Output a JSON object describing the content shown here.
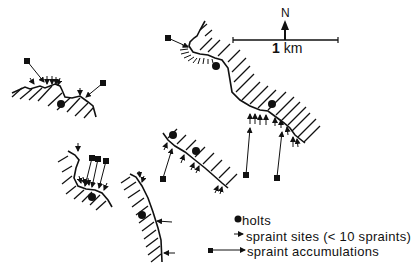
{
  "figure": {
    "north_label": "N",
    "scale": {
      "value": "1",
      "unit": "km"
    },
    "legend": {
      "items": [
        {
          "symbol": "filled-dot",
          "label": "holts"
        },
        {
          "symbol": "short-arrow",
          "label": "spraint sites (< 10 spraints)"
        },
        {
          "symbol": "long-arrow-with-square-tail",
          "label": "spraint accumulations"
        }
      ]
    },
    "colors": {
      "ink": "#111111",
      "background": "#ffffff"
    },
    "segments": [
      {
        "id": "segment-1",
        "location": "upper-left",
        "holts": 1,
        "accumulations": 2
      },
      {
        "id": "segment-2",
        "location": "upper-right (long diagonal)",
        "holts": 2,
        "accumulations": 3
      },
      {
        "id": "segment-3",
        "location": "center",
        "holts": 2,
        "accumulations": 1
      },
      {
        "id": "segment-4",
        "location": "lower-left bay",
        "holts": 1,
        "accumulations": 3
      },
      {
        "id": "segment-5",
        "location": "lower-center curve",
        "holts": 1,
        "accumulations": 0
      }
    ]
  }
}
